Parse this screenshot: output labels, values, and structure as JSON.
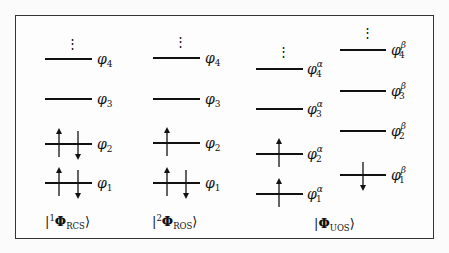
{
  "diagram": {
    "type": "molecular-orbital-occupation",
    "columns": [
      {
        "id": "rcs",
        "state_label": {
          "bra": "|",
          "sup": "1",
          "symbol": "Φ",
          "sub": "RCS",
          "ket": "⟩"
        },
        "orbitals": [
          {
            "label": "φ",
            "index": "4",
            "spin": "",
            "y": 59,
            "occupancy": "empty"
          },
          {
            "label": "φ",
            "index": "3",
            "spin": "",
            "y": 99,
            "occupancy": "empty"
          },
          {
            "label": "φ",
            "index": "2",
            "spin": "",
            "y": 144,
            "occupancy": "up-down"
          },
          {
            "label": "φ",
            "index": "1",
            "spin": "",
            "y": 183,
            "occupancy": "up-down"
          }
        ]
      },
      {
        "id": "ros",
        "state_label": {
          "bra": "|",
          "sup": "2",
          "symbol": "Φ",
          "sub": "ROS",
          "ket": "⟩"
        },
        "orbitals": [
          {
            "label": "φ",
            "index": "4",
            "spin": "",
            "y": 58,
            "occupancy": "empty"
          },
          {
            "label": "φ",
            "index": "3",
            "spin": "",
            "y": 99,
            "occupancy": "empty"
          },
          {
            "label": "φ",
            "index": "2",
            "spin": "",
            "y": 143,
            "occupancy": "up"
          },
          {
            "label": "φ",
            "index": "1",
            "spin": "",
            "y": 183,
            "occupancy": "up-down"
          }
        ]
      },
      {
        "id": "uos-alpha",
        "state_label": null,
        "orbitals": [
          {
            "label": "φ",
            "index": "4",
            "spin": "α",
            "y": 69,
            "occupancy": "empty"
          },
          {
            "label": "φ",
            "index": "3",
            "spin": "α",
            "y": 109,
            "occupancy": "empty"
          },
          {
            "label": "φ",
            "index": "2",
            "spin": "α",
            "y": 154,
            "occupancy": "up"
          },
          {
            "label": "φ",
            "index": "1",
            "spin": "α",
            "y": 194,
            "occupancy": "up"
          }
        ]
      },
      {
        "id": "uos-beta",
        "state_label": null,
        "orbitals": [
          {
            "label": "φ",
            "index": "4",
            "spin": "β",
            "y": 50,
            "occupancy": "empty"
          },
          {
            "label": "φ",
            "index": "3",
            "spin": "β",
            "y": 91,
            "occupancy": "empty"
          },
          {
            "label": "φ",
            "index": "2",
            "spin": "β",
            "y": 131,
            "occupancy": "empty"
          },
          {
            "label": "φ",
            "index": "1",
            "spin": "β",
            "y": 175,
            "occupancy": "down"
          }
        ]
      }
    ],
    "uos_state_label": {
      "bra": "|",
      "symbol": "Φ",
      "sub": "UOS",
      "ket": "⟩"
    },
    "ellipsis": "⋮"
  }
}
